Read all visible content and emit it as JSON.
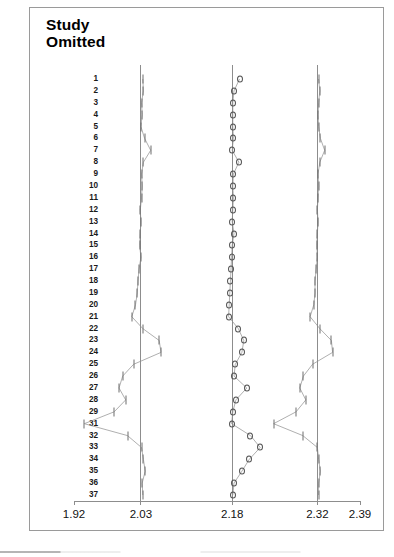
{
  "figure": {
    "title": "Study\nOmitted",
    "background_color": "#ffffff",
    "frame_color": "#9a9a9a"
  },
  "axis": {
    "tick_labels": [
      "1.92",
      "2.03",
      "2.18",
      "2.32",
      "2.39"
    ],
    "tick_values": [
      1.92,
      2.03,
      2.18,
      2.32,
      2.39
    ],
    "min": 1.92,
    "max": 2.39
  },
  "reference_lines": {
    "lower_ci": 2.03,
    "pooled": 2.18,
    "upper_ci": 2.32
  },
  "row_labels": [
    "1",
    "2",
    "3",
    "4",
    "5",
    "6",
    "7",
    "8",
    "9",
    "10",
    "11",
    "12",
    "13",
    "14",
    "15",
    "16",
    "17",
    "18",
    "19",
    "20",
    "21",
    "22",
    "23",
    "24",
    "25",
    "26",
    "27",
    "28",
    "29",
    "31",
    "32",
    "33",
    "34",
    "35",
    "36",
    "37"
  ],
  "chart_data": {
    "type": "forest",
    "title": "Study Omitted",
    "xlabel": "",
    "ylabel": "Study Omitted",
    "xlim": [
      1.92,
      2.39
    ],
    "grid": false,
    "legend": "none",
    "marker": "open-circle",
    "reference_line_values": [
      2.03,
      2.18,
      2.32
    ],
    "axis_ticks": [
      1.92,
      2.03,
      2.18,
      2.32,
      2.39
    ],
    "axis_tick_labels": [
      "1.92",
      "2.03",
      "2.18",
      "2.32",
      "2.39"
    ],
    "series": [
      {
        "name": "Lower CI limit",
        "values": [
          2.033,
          2.034,
          2.031,
          2.032,
          2.03,
          2.036,
          2.046,
          2.034,
          2.031,
          2.032,
          2.031,
          2.029,
          2.03,
          2.029,
          2.028,
          2.03,
          2.027,
          2.025,
          2.024,
          2.021,
          2.015,
          2.033,
          2.06,
          2.063,
          2.018,
          2.0,
          1.994,
          2.005,
          1.986,
          1.937,
          2.008,
          2.031,
          2.034,
          2.037,
          2.032,
          2.033
        ]
      },
      {
        "name": "Point estimate",
        "values": [
          2.192,
          2.183,
          2.181,
          2.181,
          2.181,
          2.182,
          2.18,
          2.191,
          2.182,
          2.181,
          2.182,
          2.181,
          2.18,
          2.183,
          2.18,
          2.179,
          2.178,
          2.177,
          2.176,
          2.175,
          2.174,
          2.19,
          2.199,
          2.196,
          2.185,
          2.183,
          2.204,
          2.186,
          2.181,
          2.179,
          2.21,
          2.226,
          2.208,
          2.196,
          2.183,
          2.181
        ]
      },
      {
        "name": "Upper CI limit",
        "values": [
          2.322,
          2.324,
          2.322,
          2.321,
          2.322,
          2.325,
          2.332,
          2.324,
          2.321,
          2.322,
          2.321,
          2.32,
          2.321,
          2.32,
          2.319,
          2.32,
          2.318,
          2.316,
          2.316,
          2.314,
          2.308,
          2.324,
          2.343,
          2.345,
          2.312,
          2.297,
          2.291,
          2.301,
          2.285,
          2.248,
          2.296,
          2.32,
          2.322,
          2.325,
          2.322,
          2.322
        ]
      }
    ],
    "rows": [
      {
        "label": "1",
        "low": 2.033,
        "point": 2.192,
        "high": 2.322
      },
      {
        "label": "2",
        "low": 2.034,
        "point": 2.183,
        "high": 2.324
      },
      {
        "label": "3",
        "low": 2.031,
        "point": 2.181,
        "high": 2.322
      },
      {
        "label": "4",
        "low": 2.032,
        "point": 2.181,
        "high": 2.321
      },
      {
        "label": "5",
        "low": 2.03,
        "point": 2.181,
        "high": 2.322
      },
      {
        "label": "6",
        "low": 2.036,
        "point": 2.182,
        "high": 2.325
      },
      {
        "label": "7",
        "low": 2.046,
        "point": 2.18,
        "high": 2.332
      },
      {
        "label": "8",
        "low": 2.034,
        "point": 2.191,
        "high": 2.324
      },
      {
        "label": "9",
        "low": 2.031,
        "point": 2.182,
        "high": 2.321
      },
      {
        "label": "10",
        "low": 2.032,
        "point": 2.181,
        "high": 2.322
      },
      {
        "label": "11",
        "low": 2.031,
        "point": 2.182,
        "high": 2.321
      },
      {
        "label": "12",
        "low": 2.029,
        "point": 2.181,
        "high": 2.32
      },
      {
        "label": "13",
        "low": 2.03,
        "point": 2.18,
        "high": 2.321
      },
      {
        "label": "14",
        "low": 2.029,
        "point": 2.183,
        "high": 2.32
      },
      {
        "label": "15",
        "low": 2.028,
        "point": 2.18,
        "high": 2.319
      },
      {
        "label": "16",
        "low": 2.03,
        "point": 2.179,
        "high": 2.32
      },
      {
        "label": "17",
        "low": 2.027,
        "point": 2.178,
        "high": 2.318
      },
      {
        "label": "18",
        "low": 2.025,
        "point": 2.177,
        "high": 2.316
      },
      {
        "label": "19",
        "low": 2.024,
        "point": 2.176,
        "high": 2.316
      },
      {
        "label": "20",
        "low": 2.021,
        "point": 2.175,
        "high": 2.314
      },
      {
        "label": "21",
        "low": 2.015,
        "point": 2.174,
        "high": 2.308
      },
      {
        "label": "22",
        "low": 2.033,
        "point": 2.19,
        "high": 2.324
      },
      {
        "label": "23",
        "low": 2.06,
        "point": 2.199,
        "high": 2.343
      },
      {
        "label": "24",
        "low": 2.063,
        "point": 2.196,
        "high": 2.345
      },
      {
        "label": "25",
        "low": 2.018,
        "point": 2.185,
        "high": 2.312
      },
      {
        "label": "26",
        "low": 2.0,
        "point": 2.183,
        "high": 2.297
      },
      {
        "label": "27",
        "low": 1.994,
        "point": 2.204,
        "high": 2.291
      },
      {
        "label": "28",
        "low": 2.005,
        "point": 2.186,
        "high": 2.301
      },
      {
        "label": "29",
        "low": 1.986,
        "point": 2.181,
        "high": 2.285
      },
      {
        "label": "31",
        "low": 1.937,
        "point": 2.179,
        "high": 2.248
      },
      {
        "label": "32",
        "low": 2.008,
        "point": 2.21,
        "high": 2.296
      },
      {
        "label": "33",
        "low": 2.031,
        "point": 2.226,
        "high": 2.32
      },
      {
        "label": "34",
        "low": 2.034,
        "point": 2.208,
        "high": 2.322
      },
      {
        "label": "35",
        "low": 2.037,
        "point": 2.196,
        "high": 2.325
      },
      {
        "label": "36",
        "low": 2.032,
        "point": 2.183,
        "high": 2.322
      },
      {
        "label": "37",
        "low": 2.033,
        "point": 2.181,
        "high": 2.322
      }
    ]
  }
}
